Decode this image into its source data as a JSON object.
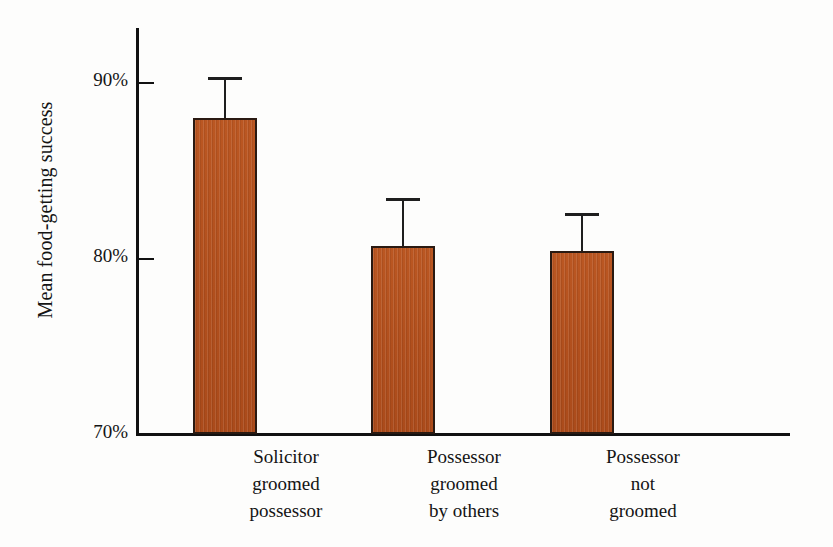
{
  "chart_data": {
    "type": "bar",
    "title": "",
    "xlabel": "",
    "ylabel": "Mean food-getting success",
    "ylim": [
      70,
      93.5
    ],
    "yticks": [
      70,
      80,
      90
    ],
    "ytick_labels": [
      "70%",
      "80%",
      "90%"
    ],
    "grid": false,
    "legend": "none",
    "categories": [
      "Solicitor groomed possessor",
      "Possessor groomed by others",
      "Possessor not groomed"
    ],
    "category_lines": [
      [
        "Solicitor",
        "groomed",
        "possessor"
      ],
      [
        "Possessor",
        "groomed",
        "by others"
      ],
      [
        "Possessor",
        "not",
        "groomed"
      ]
    ],
    "values": [
      88.3,
      80.9,
      80.6
    ],
    "error_high": [
      90.5,
      83.5,
      82.6
    ],
    "error_bars": [
      2.2,
      2.6,
      2.0
    ],
    "series": [
      {
        "name": "Mean food-getting success",
        "values": [
          88.3,
          80.9,
          80.6
        ]
      }
    ],
    "bar_color": "#b5521f",
    "bar_edge_color": "#2a1a12",
    "error_bar_color": "#1e1e1e",
    "axis_color": "#111111",
    "background_color": "#fdfdfc"
  },
  "axis": {
    "y_title": "Mean food-getting success",
    "tick_90": "90%",
    "tick_80": "80%",
    "tick_70": "70%"
  },
  "categories": [
    {
      "line1": "Solicitor",
      "line2": "groomed",
      "line3": "possessor"
    },
    {
      "line1": "Possessor",
      "line2": "groomed",
      "line3": "by others"
    },
    {
      "line1": "Possessor",
      "line2": "not",
      "line3": "groomed"
    }
  ]
}
